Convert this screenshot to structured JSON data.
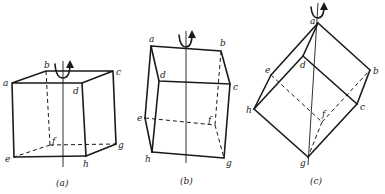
{
  "figure": {
    "panels": [
      {
        "id": "a",
        "caption": "(a)",
        "labels": {
          "a": "a",
          "b": "b",
          "c": "c",
          "d": "d",
          "e": "e",
          "f": "f",
          "g": "g",
          "h": "h"
        }
      },
      {
        "id": "b",
        "caption": "(b)",
        "labels": {
          "a": "a",
          "b": "b",
          "c": "c",
          "d": "d",
          "e": "e",
          "f": "f",
          "g": "g",
          "h": "h"
        }
      },
      {
        "id": "c",
        "caption": "(c)",
        "labels": {
          "a": "a",
          "b": "b",
          "c": "c",
          "d": "d",
          "e": "e",
          "f": "f",
          "g": "g",
          "h": "h"
        }
      }
    ],
    "line_color": "#1a1a1a"
  }
}
